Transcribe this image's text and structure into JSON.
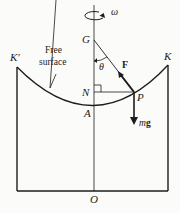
{
  "diagram": {
    "labels": {
      "omega": "ω",
      "G": "G",
      "K_prime": "K′",
      "K": "K",
      "free_surface_line1": "Free",
      "free_surface_line2": "surface",
      "theta": "θ",
      "F": "F",
      "N": "N",
      "P": "P",
      "A": "A",
      "m": "m",
      "g": "g",
      "O": "O"
    },
    "colors": {
      "ink": "#1c1c1c",
      "background": "#fbfbf9"
    }
  }
}
